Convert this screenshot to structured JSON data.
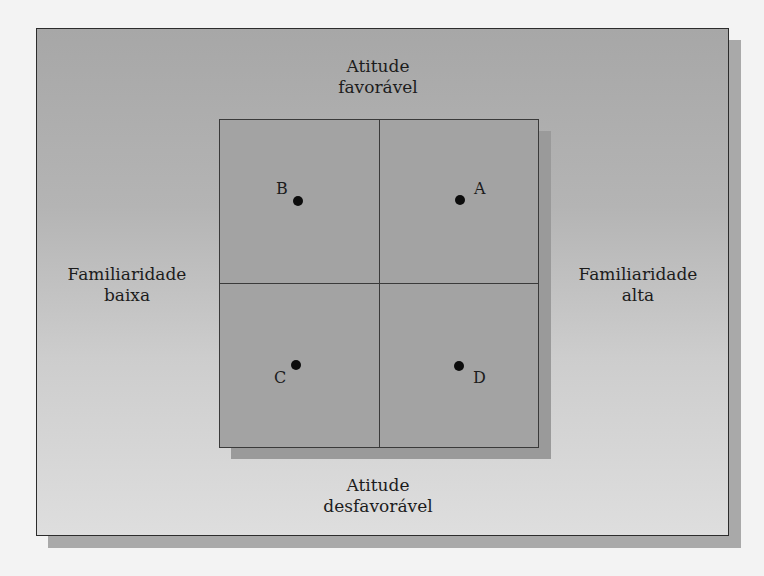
{
  "diagram": {
    "type": "perceptual-quadrant-map",
    "axes": {
      "top": [
        "Atitude",
        "favorável"
      ],
      "bottom": [
        "Atitude",
        "desfavorável"
      ],
      "left": [
        "Familiaridade",
        "baixa"
      ],
      "right": [
        "Familiaridade",
        "alta"
      ]
    },
    "points": [
      {
        "label": "A",
        "quadrant": "top-right",
        "description": "Familiaridade alta, atitude favorável"
      },
      {
        "label": "B",
        "quadrant": "top-left",
        "description": "Familiaridade baixa, atitude favorável"
      },
      {
        "label": "C",
        "quadrant": "bottom-left",
        "description": "Familiaridade baixa, atitude desfavorável"
      },
      {
        "label": "D",
        "quadrant": "bottom-right",
        "description": "Familiaridade alta, atitude desfavorável"
      }
    ],
    "colors": {
      "outer_box_top": "#a7a7a7",
      "outer_box_bottom": "#dedede",
      "inner_square": "#a3a3a3",
      "shadow": "#a9a9a9",
      "lines": "#2c2c2c",
      "dots": "#0d0d0d"
    }
  }
}
